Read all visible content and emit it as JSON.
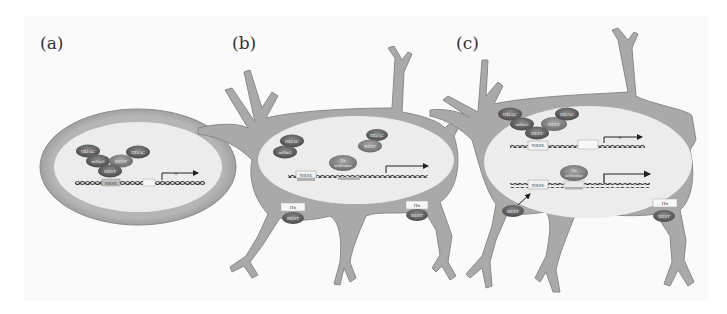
{
  "figure": {
    "panels": [
      {
        "label": "(a)",
        "cell_type": "oval cell",
        "nucleus_proteins": [
          "HDAC",
          "mSin3",
          "REST",
          "HDAC",
          "REST"
        ],
        "dna_elements": [
          "NRSE"
        ],
        "transcription": "blocked"
      },
      {
        "label": "(b)",
        "cell_type": "neuron",
        "nucleus_proteins": [
          "HDAC",
          "mSin3",
          "HDAC",
          "REST",
          "Tx activator"
        ],
        "dna_elements": [
          "NRSE"
        ],
        "transcription": "active",
        "cytoplasm": [
          {
            "top": "Htt",
            "bottom": "REST"
          },
          {
            "top": "Htt",
            "bottom": "REST"
          }
        ]
      },
      {
        "label": "(c)",
        "cell_type": "neuron",
        "nucleus_proteins": [
          "HDAC",
          "mSin3",
          "REST",
          "HDAC",
          "REST"
        ],
        "dna_elements": [
          "NRSE",
          "NRSE"
        ],
        "transcription_rows": [
          "blocked",
          "active"
        ],
        "tx_label": "Tx activator",
        "cytoplasm": [
          {
            "bottom": "REST",
            "arrow_to": "NRSE"
          },
          {
            "top": "Htt",
            "bottom": "REST"
          }
        ]
      }
    ],
    "labels": {
      "a": "(a)",
      "b": "(b)",
      "c": "(c)",
      "hdac": "HDAC",
      "msin3": "mSin3",
      "rest": "REST",
      "nrse": "NRSE",
      "tx1": "Tx",
      "tx2": "activator",
      "htt": "Htt",
      "x": "×"
    },
    "colors": {
      "cell_body": "#a9a9a9",
      "cell_outline": "#8a8a8a",
      "nucleus": "#ececec",
      "protein_dark": "#555555",
      "protein_mid": "#7a7a7a",
      "dna": "#444444"
    }
  }
}
